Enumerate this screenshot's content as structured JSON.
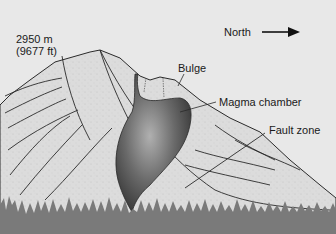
{
  "diagram": {
    "title": "",
    "elevation": {
      "meters": "2950 m",
      "feet": "(9677 ft)"
    },
    "direction": {
      "label": "North",
      "arrow": "right-arrow-icon"
    },
    "labels": {
      "bulge": "Bulge",
      "magma_chamber": "Magma chamber",
      "fault_zone": "Fault zone"
    },
    "colors": {
      "background": "#e8e8e8",
      "mountain_fill": "#d9d9d9",
      "outline": "#2a2a2a",
      "magma_dark": "#3a3a3a",
      "magma_light": "#9a9a9a",
      "forest": "#7a7a7a"
    }
  }
}
